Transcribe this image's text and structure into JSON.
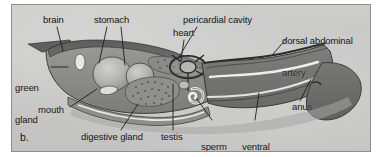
{
  "figure": {
    "panel_letter": "b.",
    "caption_subject": "crayfish internal anatomy, lateral view",
    "colors": {
      "panel_background": "#c9c9c7",
      "panel_border": "#8e8e8c",
      "body_dark": "#6d6d6b",
      "body_mid": "#8c8c8a",
      "body_light": "#a8a8a6",
      "organ_highlight": "#bdbdbb",
      "outline": "#3a3a38",
      "label_text": "#181818",
      "leader_line": "#1e1e1c",
      "white_structure": "#f2f2f0"
    },
    "labels": [
      {
        "id": "brain",
        "text": "brain",
        "lines": [
          "brain"
        ],
        "x": 42,
        "y": 14,
        "leader": {
          "x1": 56,
          "y1": 26,
          "x2": 62,
          "y2": 50
        }
      },
      {
        "id": "stomach",
        "text": "stomach",
        "lines": [
          "stomach"
        ],
        "x": 93,
        "y": 14,
        "leader": {
          "x1": 106,
          "y1": 26,
          "x2": 98,
          "y2": 62
        },
        "leader2": {
          "x1": 120,
          "y1": 26,
          "x2": 124,
          "y2": 64
        }
      },
      {
        "id": "pericardial-cavity",
        "text": "pericardial cavity",
        "lines": [
          "pericardial cavity"
        ],
        "x": 182,
        "y": 14,
        "leader": {
          "x1": 196,
          "y1": 26,
          "x2": 178,
          "y2": 56
        }
      },
      {
        "id": "heart",
        "text": "heart",
        "lines": [
          "heart"
        ],
        "x": 172,
        "y": 27,
        "leader": {
          "x1": 183,
          "y1": 39,
          "x2": 180,
          "y2": 60
        }
      },
      {
        "id": "dorsal-abdominal-artery",
        "text": "dorsal abdominal artery",
        "lines": [
          "dorsal abdominal",
          "artery"
        ],
        "x": 281,
        "y": 14,
        "leader": {
          "x1": 286,
          "y1": 37,
          "x2": 272,
          "y2": 53
        }
      },
      {
        "id": "green-gland",
        "text": "green gland",
        "lines": [
          "green",
          "gland"
        ],
        "x": 14,
        "y": 61,
        "leader": {
          "x1": 50,
          "y1": 66,
          "x2": 67,
          "y2": 66
        }
      },
      {
        "id": "mouth",
        "text": "mouth",
        "lines": [
          "mouth"
        ],
        "x": 37,
        "y": 104,
        "leader": {
          "x1": 69,
          "y1": 106,
          "x2": 96,
          "y2": 88
        }
      },
      {
        "id": "digestive-gland",
        "text": "digestive gland",
        "lines": [
          "digestive gland"
        ],
        "x": 80,
        "y": 131,
        "leader": {
          "x1": 120,
          "y1": 129,
          "x2": 137,
          "y2": 103
        }
      },
      {
        "id": "testis",
        "text": "testis",
        "lines": [
          "testis"
        ],
        "x": 160,
        "y": 131,
        "leader": {
          "x1": 172,
          "y1": 129,
          "x2": 172,
          "y2": 83
        }
      },
      {
        "id": "sperm-duct",
        "text": "sperm duct",
        "lines": [
          "sperm",
          "duct"
        ],
        "x": 200,
        "y": 120,
        "leader": {
          "x1": 211,
          "y1": 119,
          "x2": 196,
          "y2": 98
        }
      },
      {
        "id": "ventral-nerve-cord",
        "text": "ventral nerve cord",
        "lines": [
          "ventral",
          "nerve cord"
        ],
        "x": 241,
        "y": 120,
        "leader": {
          "x1": 254,
          "y1": 119,
          "x2": 258,
          "y2": 92
        }
      },
      {
        "id": "anus",
        "text": "anus",
        "lines": [
          "anus"
        ],
        "x": 291,
        "y": 101,
        "leader": {
          "x1": 299,
          "y1": 100,
          "x2": 310,
          "y2": 78
        }
      }
    ]
  }
}
